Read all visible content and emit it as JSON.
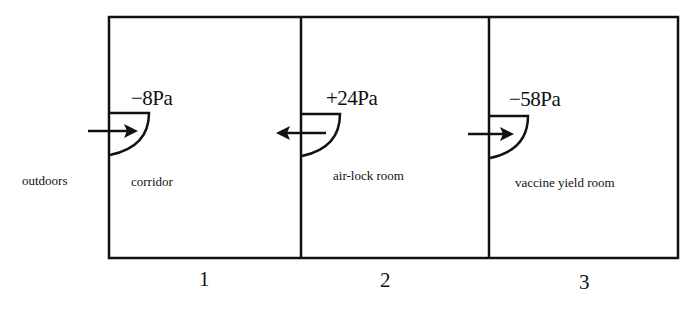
{
  "diagram": {
    "type": "pressure-gradient-floor-plan",
    "outside_label": "outdoors",
    "rooms": [
      {
        "number": "1",
        "name": "corridor",
        "pressure": "−8Pa",
        "door_airflow": "into room (from outdoors)"
      },
      {
        "number": "2",
        "name": "air-lock room",
        "pressure": "+24Pa",
        "door_airflow": "out of room (toward corridor)"
      },
      {
        "number": "3",
        "name": "vaccine yield room",
        "pressure": "−58Pa",
        "door_airflow": "into room (from air-lock)"
      }
    ],
    "colors": {
      "line": "#111111",
      "background": "#ffffff"
    }
  }
}
